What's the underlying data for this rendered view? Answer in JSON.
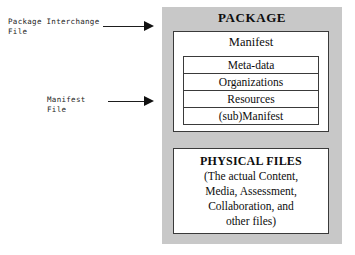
{
  "diagram": {
    "background_color": "#ffffff",
    "panel_color": "#c8c8c8",
    "line_color": "#1d1d1d",
    "text_color": "#0d0d0d"
  },
  "annotations": {
    "package_interchange_file_label": "Package Interchange\nFile",
    "manifest_file_label": "Manifest File"
  },
  "package": {
    "title": "PACKAGE",
    "manifest": {
      "title": "Manifest",
      "rows": [
        {
          "label": "Meta-data"
        },
        {
          "label": "Organizations"
        },
        {
          "label": "Resources"
        },
        {
          "label": "(sub)Manifest"
        }
      ]
    },
    "physical_files": {
      "title": "PHYSICAL FILES",
      "lines": [
        "(The actual Content,",
        "Media, Assessment,",
        "Collaboration, and",
        "other files)"
      ]
    }
  }
}
